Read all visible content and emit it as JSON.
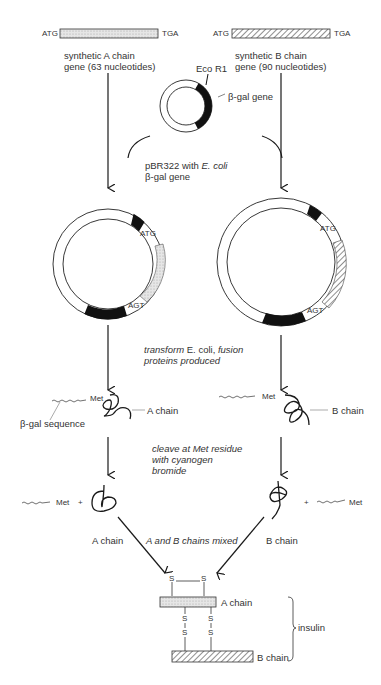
{
  "genes": {
    "a": {
      "start": "ATG",
      "stop": "TGA",
      "line1": "synthetic A chain",
      "line2": "gene (63 nucleotides)"
    },
    "b": {
      "start": "ATG",
      "stop": "TGA",
      "line1": "synthetic B chain",
      "line2": "gene (90 nucleotides)"
    }
  },
  "plasmid": {
    "eco": "Eco R1",
    "bgal": "β-gal gene",
    "caption_line1_a": "pBR322 with ",
    "caption_line1_b": "E. coli",
    "caption_line2": "β-gal gene"
  },
  "recombinant": {
    "a": {
      "atg": "ATG",
      "agt": "AGT"
    },
    "b": {
      "atg": "ATG",
      "agt": "AGT"
    }
  },
  "steps": {
    "transform_a": "transform",
    "transform_b": " E. coli, ",
    "transform_c": "fusion",
    "transform_line2": "proteins produced",
    "cleave_line1": "cleave at Met residue",
    "cleave_line2": "with cyanogen",
    "cleave_line3": "bromide",
    "mixed": "A and B chains mixed"
  },
  "fusion": {
    "met_a": "Met",
    "met_b": "Met",
    "bgal_seq": "β-gal sequence",
    "a_chain": "A chain",
    "b_chain": "B chain"
  },
  "cleaved": {
    "met_a": "Met",
    "plus_a": "+",
    "met_b": "Met",
    "plus_b": "+",
    "a_chain": "A chain",
    "b_chain": "B chain"
  },
  "insulin": {
    "a_chain": "A chain",
    "b_chain": "B chain",
    "label": "insulin",
    "s": "S"
  },
  "colors": {
    "ink": "#1a1a1a",
    "stipple": "#d9d9d9",
    "hatch": "#555555"
  }
}
